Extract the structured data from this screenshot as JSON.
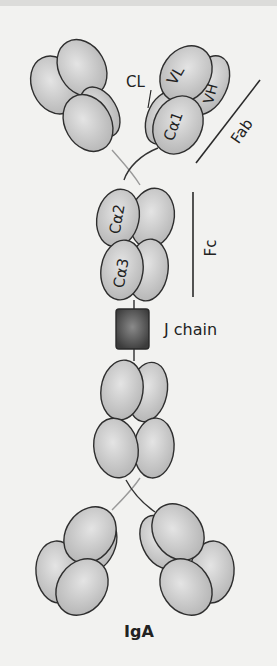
{
  "figure": {
    "title": "IgA",
    "labels": {
      "cl": "CL",
      "vl": "VL",
      "vh": "VH",
      "ca1": "Cα1",
      "ca2": "Cα2",
      "ca3": "Cα3",
      "fab": "Fab",
      "fc": "Fc",
      "j_chain": "J chain"
    },
    "colors": {
      "domain_fill": "#c8c8c8",
      "domain_stroke": "#2e2e2e",
      "j_chain_fill": "#555555",
      "background": "#f2f2f0"
    }
  }
}
